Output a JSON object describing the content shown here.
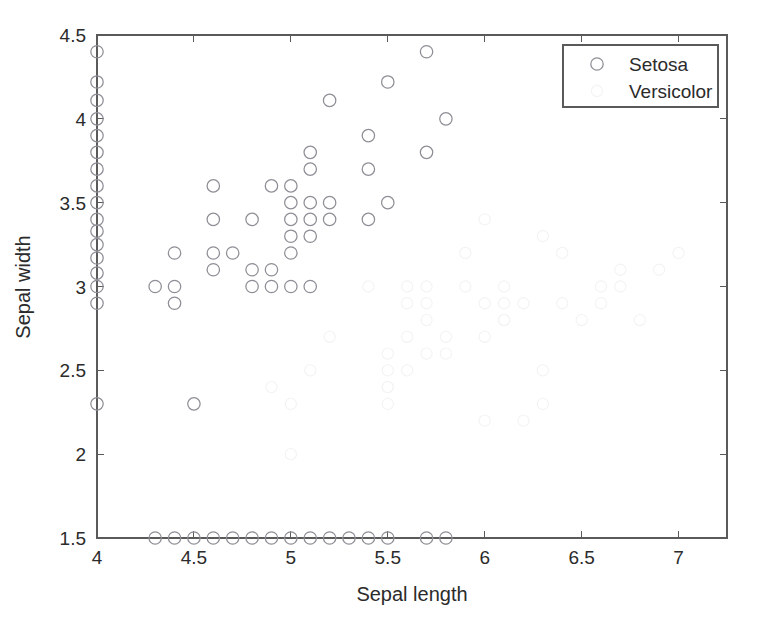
{
  "figure": {
    "background_color": "#ffffff",
    "axis_color": "#5a5a5a",
    "text_color": "#2b2b2b"
  },
  "chart_data": {
    "type": "scatter",
    "title": "",
    "xlabel": "Sepal length",
    "ylabel": "Sepal width",
    "xlim": [
      4,
      7.25
    ],
    "ylim": [
      1.5,
      4.5
    ],
    "xticks": [
      4,
      4.5,
      5,
      5.5,
      6,
      6.5,
      7
    ],
    "xticklabels": [
      "4",
      "4.5",
      "5",
      "5.5",
      "6",
      "6.5",
      "7"
    ],
    "yticks": [
      1.5,
      2,
      2.5,
      3,
      3.5,
      4,
      4.5
    ],
    "yticklabels": [
      "1.5",
      "2",
      "2.5",
      "3",
      "3.5",
      "4",
      "4.5"
    ],
    "grid": false,
    "legend_position": "upper right",
    "marker_shape": "circle-open",
    "series": [
      {
        "name": "Setosa",
        "marker_color": "#8e8e96",
        "visible": true,
        "points": [
          [
            4.0,
            4.4
          ],
          [
            4.0,
            4.22
          ],
          [
            4.0,
            4.11
          ],
          [
            4.0,
            4.0
          ],
          [
            4.0,
            3.9
          ],
          [
            4.0,
            3.8
          ],
          [
            4.0,
            3.7
          ],
          [
            4.0,
            3.6
          ],
          [
            4.0,
            3.5
          ],
          [
            4.0,
            3.4
          ],
          [
            4.0,
            3.33
          ],
          [
            4.0,
            3.25
          ],
          [
            4.0,
            3.17
          ],
          [
            4.0,
            3.08
          ],
          [
            4.0,
            3.0
          ],
          [
            4.0,
            2.9
          ],
          [
            4.0,
            2.3
          ],
          [
            4.3,
            3.0
          ],
          [
            4.4,
            3.2
          ],
          [
            4.4,
            3.0
          ],
          [
            4.4,
            2.9
          ],
          [
            4.5,
            2.3
          ],
          [
            4.6,
            3.6
          ],
          [
            4.6,
            3.4
          ],
          [
            4.6,
            3.2
          ],
          [
            4.6,
            3.1
          ],
          [
            4.7,
            3.2
          ],
          [
            4.8,
            3.4
          ],
          [
            4.8,
            3.1
          ],
          [
            4.8,
            3.0
          ],
          [
            4.9,
            3.6
          ],
          [
            4.9,
            3.1
          ],
          [
            4.9,
            3.0
          ],
          [
            5.0,
            3.6
          ],
          [
            5.0,
            3.5
          ],
          [
            5.0,
            3.4
          ],
          [
            5.0,
            3.3
          ],
          [
            5.0,
            3.2
          ],
          [
            5.0,
            3.0
          ],
          [
            5.1,
            3.8
          ],
          [
            5.1,
            3.7
          ],
          [
            5.1,
            3.5
          ],
          [
            5.1,
            3.4
          ],
          [
            5.1,
            3.3
          ],
          [
            5.1,
            3.0
          ],
          [
            5.2,
            4.11
          ],
          [
            5.2,
            3.5
          ],
          [
            5.2,
            3.4
          ],
          [
            5.4,
            3.9
          ],
          [
            5.4,
            3.7
          ],
          [
            5.4,
            3.4
          ],
          [
            5.5,
            4.22
          ],
          [
            5.5,
            3.5
          ],
          [
            5.7,
            4.4
          ],
          [
            5.7,
            3.8
          ],
          [
            5.8,
            4.0
          ],
          [
            4.3,
            1.5
          ],
          [
            4.4,
            1.5
          ],
          [
            4.5,
            1.5
          ],
          [
            4.6,
            1.5
          ],
          [
            4.7,
            1.5
          ],
          [
            4.8,
            1.5
          ],
          [
            4.9,
            1.5
          ],
          [
            5.0,
            1.5
          ],
          [
            5.1,
            1.5
          ],
          [
            5.2,
            1.5
          ],
          [
            5.3,
            1.5
          ],
          [
            5.4,
            1.5
          ],
          [
            5.5,
            1.5
          ],
          [
            5.7,
            1.5
          ],
          [
            5.8,
            1.5
          ]
        ]
      },
      {
        "name": "Versicolor",
        "marker_color": "#f3f3f4",
        "visible": true,
        "points": [
          [
            4.9,
            2.4
          ],
          [
            5.0,
            2.0
          ],
          [
            5.0,
            2.3
          ],
          [
            5.1,
            2.5
          ],
          [
            5.2,
            2.7
          ],
          [
            5.4,
            3.0
          ],
          [
            5.5,
            2.3
          ],
          [
            5.5,
            2.4
          ],
          [
            5.5,
            2.4
          ],
          [
            5.5,
            2.5
          ],
          [
            5.5,
            2.6
          ],
          [
            5.6,
            2.5
          ],
          [
            5.6,
            2.7
          ],
          [
            5.6,
            2.9
          ],
          [
            5.6,
            3.0
          ],
          [
            5.7,
            2.6
          ],
          [
            5.7,
            2.8
          ],
          [
            5.7,
            2.9
          ],
          [
            5.7,
            3.0
          ],
          [
            5.8,
            2.6
          ],
          [
            5.8,
            2.7
          ],
          [
            5.9,
            3.0
          ],
          [
            5.9,
            3.2
          ],
          [
            6.0,
            2.2
          ],
          [
            6.0,
            2.7
          ],
          [
            6.0,
            2.9
          ],
          [
            6.0,
            3.4
          ],
          [
            6.1,
            2.8
          ],
          [
            6.1,
            2.8
          ],
          [
            6.1,
            2.9
          ],
          [
            6.1,
            3.0
          ],
          [
            6.2,
            2.2
          ],
          [
            6.2,
            2.9
          ],
          [
            6.3,
            2.3
          ],
          [
            6.3,
            2.5
          ],
          [
            6.3,
            3.3
          ],
          [
            6.4,
            2.9
          ],
          [
            6.4,
            3.2
          ],
          [
            6.5,
            2.8
          ],
          [
            6.6,
            2.9
          ],
          [
            6.6,
            3.0
          ],
          [
            6.7,
            3.0
          ],
          [
            6.7,
            3.1
          ],
          [
            6.8,
            2.8
          ],
          [
            6.9,
            3.1
          ],
          [
            7.0,
            3.2
          ]
        ]
      }
    ]
  },
  "legend": {
    "entries": [
      {
        "label": "Setosa",
        "marker_color": "#8e8e96",
        "marker": "circle-open"
      },
      {
        "label": "Versicolor",
        "marker_color": "#f3f3f4",
        "marker": "circle-open"
      }
    ]
  }
}
